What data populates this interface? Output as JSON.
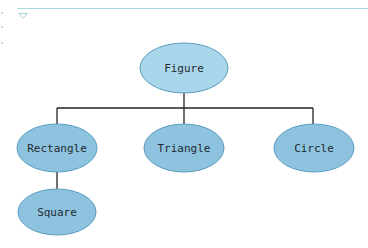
{
  "diagram": {
    "type": "class-hierarchy",
    "colors": {
      "node_fill": "#8ec3e0",
      "node_fill_root": "#a9d6ea",
      "node_stroke": "#5a9cc0",
      "edge": "#222222",
      "top_rule": "#a8d8e0"
    },
    "nodes": [
      {
        "id": "figure",
        "label": "Figure",
        "cx": 184,
        "cy": 68,
        "rx": 44,
        "ry": 25
      },
      {
        "id": "rectangle",
        "label": "Rectangle",
        "cx": 57,
        "cy": 148,
        "rx": 40,
        "ry": 24
      },
      {
        "id": "triangle",
        "label": "Triangle",
        "cx": 184,
        "cy": 148,
        "rx": 40,
        "ry": 24
      },
      {
        "id": "circle",
        "label": "Circle",
        "cx": 314,
        "cy": 148,
        "rx": 40,
        "ry": 24
      },
      {
        "id": "square",
        "label": "Square",
        "cx": 57,
        "cy": 212,
        "rx": 39,
        "ry": 23
      }
    ],
    "edges": [
      {
        "from": "figure",
        "to": "rectangle"
      },
      {
        "from": "figure",
        "to": "triangle"
      },
      {
        "from": "figure",
        "to": "circle"
      },
      {
        "from": "rectangle",
        "to": "square"
      }
    ]
  }
}
